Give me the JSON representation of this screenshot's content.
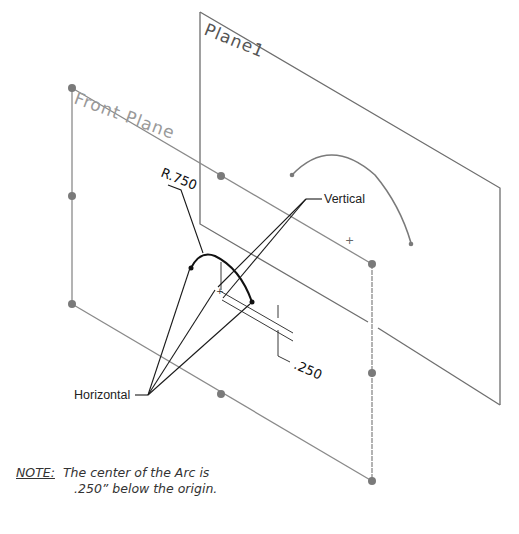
{
  "planes": {
    "plane1": {
      "label": "Plane1",
      "color": "#6e6e6e"
    },
    "front_plane": {
      "label": "Front Plane",
      "color": "#8a8a8a"
    }
  },
  "callouts": {
    "vertical": "Vertical",
    "horizontal": "Horizontal"
  },
  "dimensions": {
    "radius": "R.750",
    "offset": ".250"
  },
  "note": {
    "label": "NOTE:",
    "line1": "The center of the Arc is",
    "line2": ".250” below the origin."
  },
  "colors": {
    "sketch": "#111111",
    "plane_edge": "#8a8a8a",
    "handle": "#7a7a7a",
    "background": "#ffffff"
  }
}
